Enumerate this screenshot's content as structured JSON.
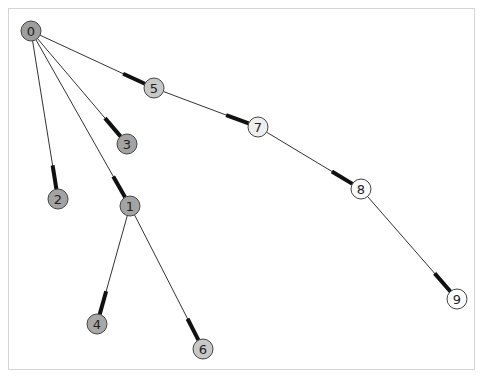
{
  "graph": {
    "type": "tree",
    "nodes": [
      {
        "id": "0",
        "x": 31,
        "y": 31,
        "fill": "#9e9e9e"
      },
      {
        "id": "1",
        "x": 130,
        "y": 206,
        "fill": "#a3a3a3"
      },
      {
        "id": "2",
        "x": 58,
        "y": 199,
        "fill": "#a3a3a3"
      },
      {
        "id": "3",
        "x": 127,
        "y": 144,
        "fill": "#a3a3a3"
      },
      {
        "id": "4",
        "x": 97,
        "y": 324,
        "fill": "#a8a8a8"
      },
      {
        "id": "5",
        "x": 154,
        "y": 88,
        "fill": "#c8c8c8"
      },
      {
        "id": "6",
        "x": 203,
        "y": 349,
        "fill": "#c8c8c8"
      },
      {
        "id": "7",
        "x": 258,
        "y": 127,
        "fill": "#eeeeee"
      },
      {
        "id": "8",
        "x": 361,
        "y": 189,
        "fill": "#fafafa"
      },
      {
        "id": "9",
        "x": 457,
        "y": 299,
        "fill": "#ffffff"
      }
    ],
    "edges": [
      {
        "source": "0",
        "target": "5"
      },
      {
        "source": "0",
        "target": "3"
      },
      {
        "source": "0",
        "target": "2"
      },
      {
        "source": "0",
        "target": "1"
      },
      {
        "source": "1",
        "target": "4"
      },
      {
        "source": "1",
        "target": "6"
      },
      {
        "source": "5",
        "target": "7"
      },
      {
        "source": "7",
        "target": "8"
      },
      {
        "source": "8",
        "target": "9"
      }
    ],
    "node_radius": 10,
    "edge_color": "#333333",
    "arrow_color": "#111111",
    "node_stroke": "#444444"
  }
}
